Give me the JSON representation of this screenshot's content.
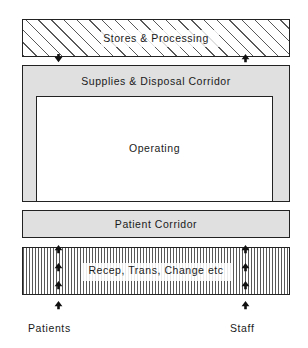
{
  "diagram": {
    "zones": {
      "stores": {
        "label": "Stores & Processing",
        "fill": "diagonal-hatch"
      },
      "supplies_corridor": {
        "label": "Supplies & Disposal Corridor",
        "fill": "#e0e0e0"
      },
      "operating": {
        "label": "Operating",
        "fill": "#ffffff"
      },
      "patient_corridor": {
        "label": "Patient Corridor",
        "fill": "#e0e0e0"
      },
      "reception": {
        "label": "Recep, Trans, Change etc",
        "fill": "vertical-stripe"
      }
    },
    "flows": {
      "patients": "Patients",
      "staff": "Staff"
    },
    "arrows": {
      "stores_in": {
        "name": "supplies-in-arrow",
        "direction": "down"
      },
      "stores_out": {
        "name": "disposal-out-arrow",
        "direction": "up"
      },
      "patients_entry": {
        "direction": "up",
        "count": 4
      },
      "staff_entry": {
        "direction": "up",
        "count": 4
      }
    },
    "colors": {
      "line": "#222222",
      "corridor_fill": "#e0e0e0",
      "room_fill": "#ffffff",
      "text": "#1a1a1a"
    }
  }
}
